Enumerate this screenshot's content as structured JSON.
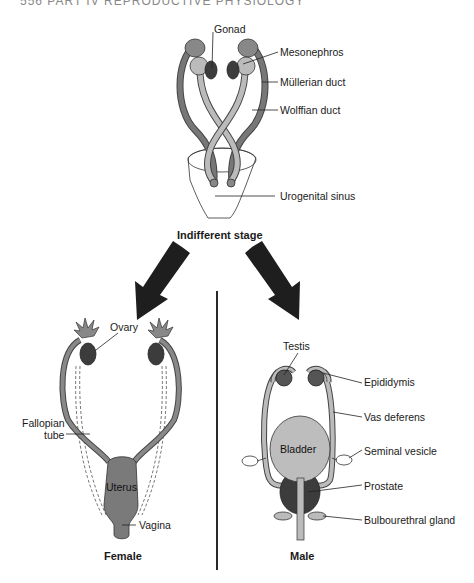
{
  "page_header": "556    PART IV  REPRODUCTIVE PHYSIOLOGY",
  "indifferent": {
    "title": "Indifferent stage",
    "labels": {
      "gonad": "Gonad",
      "mesonephros": "Mesonephros",
      "mullerian_duct": "Müllerian duct",
      "wolffian_duct": "Wolffian duct",
      "urogenital_sinus": "Urogenital sinus"
    }
  },
  "female": {
    "title": "Female",
    "labels": {
      "ovary": "Ovary",
      "fallopian_tube_line1": "Fallopian",
      "fallopian_tube_line2": "tube",
      "uterus": "Uterus",
      "vagina": "Vagina"
    }
  },
  "male": {
    "title": "Male",
    "labels": {
      "testis": "Testis",
      "epididymis": "Epididymis",
      "vas_deferens": "Vas deferens",
      "bladder": "Bladder",
      "seminal_vesicle": "Seminal vesicle",
      "prostate": "Prostate",
      "bulbourethral_gland": "Bulbourethral gland"
    }
  },
  "colors": {
    "duct_dark": "#6e6e6e",
    "duct_light": "#b4b4b4",
    "organ_dark": "#3c3c3c",
    "organ_mid": "#7a7a7a",
    "bladder": "#bdbdbd",
    "arrow": "#1e1e1e"
  }
}
